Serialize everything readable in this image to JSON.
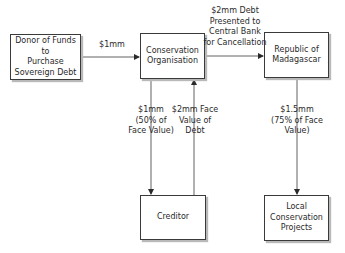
{
  "diagram": {
    "nodes": [
      {
        "id": "donor",
        "label": "Donor of Funds to\nPurchase\nSovereign Debt"
      },
      {
        "id": "conservation_org",
        "label": "Conservation\nOrganisation"
      },
      {
        "id": "madagascar",
        "label": "Republic of\nMadagascar"
      },
      {
        "id": "creditor",
        "label": "Creditor"
      },
      {
        "id": "local_projects",
        "label": "Local\nConservation\nProjects"
      }
    ],
    "edges": [
      {
        "from": "donor",
        "to": "conservation_org",
        "label": "$1mm"
      },
      {
        "from": "conservation_org",
        "to": "madagascar",
        "label": "$2mm Debt\nPresented to\nCentral Bank\nfor Cancellation"
      },
      {
        "from": "conservation_org",
        "to": "creditor",
        "label": "$1mm\n(50% of\nFace Value)"
      },
      {
        "from": "creditor",
        "to": "conservation_org",
        "label": "$2mm Face\nValue of\nDebt"
      },
      {
        "from": "madagascar",
        "to": "local_projects",
        "label": "$1.5mm\n(75% of Face\nValue)"
      }
    ]
  },
  "colors": {
    "line": "#3a3a3a",
    "shadow": "#b9b9b9",
    "background": "#ffffff"
  }
}
